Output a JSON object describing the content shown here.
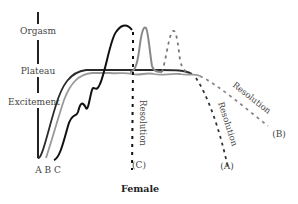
{
  "diagram": {
    "title": "Female",
    "stages": [
      {
        "label": "Orgasm"
      },
      {
        "label": "Plateau"
      },
      {
        "label": "Excitement"
      }
    ],
    "curve_labels": {
      "start": "A B C",
      "a": "(A)",
      "b": "(B)",
      "c": "(C)"
    },
    "resolution_labels": {
      "a": "Resolution",
      "b": "Resolution",
      "c": "Resolution"
    },
    "colors": {
      "curve_a": "#1a1a1a",
      "curve_b": "#999999",
      "curve_c": "#222222",
      "axis": "#222222",
      "text": "#444444"
    }
  }
}
